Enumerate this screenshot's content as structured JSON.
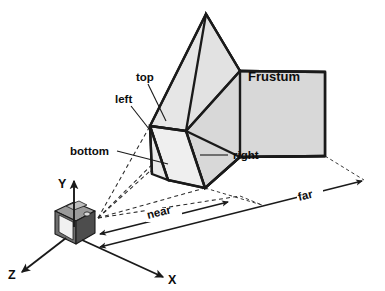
{
  "diagram": {
    "canvas": {
      "width": 385,
      "height": 291,
      "background": "#ffffff"
    },
    "colors": {
      "frustum_fill_light": "#e6e6e6",
      "frustum_fill_mid": "#dcdcdc",
      "frustum_fill_dark": "#d2d2d2",
      "near_plane_fill": "#efefef",
      "outline": "#1a1a1a",
      "dashed_ray": "#2b2b2b",
      "camera_body": "#6e6e6e",
      "camera_front": "#f2f2f2",
      "camera_top": "#9a9a9a",
      "camera_side": "#4a4a4a",
      "text": "#0d0d0d"
    },
    "labels": {
      "frustum": "Frustum",
      "top": "top",
      "left": "left",
      "bottom": "bottom",
      "right": "right",
      "near": "near",
      "far": "far"
    },
    "axes": [
      {
        "name": "y-axis",
        "label": "Y",
        "direction": "up"
      },
      {
        "name": "x-axis",
        "label": "X",
        "direction": "down-right"
      },
      {
        "name": "z-axis",
        "label": "Z",
        "direction": "down-left"
      }
    ],
    "camera": {
      "name": "camera",
      "label": ""
    },
    "planes": [
      {
        "name": "near-plane",
        "label": "near"
      },
      {
        "name": "far-plane",
        "label": "far"
      }
    ],
    "frustum_sides": [
      {
        "name": "top",
        "label": "top"
      },
      {
        "name": "left",
        "label": "left"
      },
      {
        "name": "bottom",
        "label": "bottom"
      },
      {
        "name": "right",
        "label": "right"
      }
    ]
  }
}
